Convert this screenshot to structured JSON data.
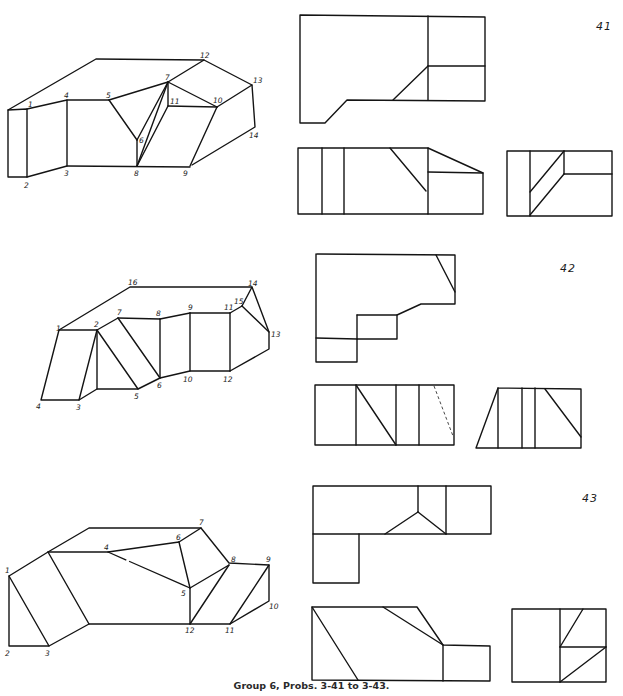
{
  "caption": "Group 6, Probs. 3-41 to 3-43.",
  "problems": [
    {
      "number": "41",
      "isometric_labels": [
        "1",
        "2",
        "3",
        "4",
        "5",
        "6",
        "7",
        "8",
        "9",
        "10",
        "11",
        "12",
        "13",
        "14"
      ],
      "views": [
        "top-view",
        "front-view",
        "side-view"
      ]
    },
    {
      "number": "42",
      "isometric_labels": [
        "1",
        "2",
        "3",
        "4",
        "5",
        "6",
        "7",
        "8",
        "9",
        "10",
        "11",
        "12",
        "13",
        "14",
        "15",
        "16"
      ],
      "views": [
        "top-view",
        "front-view",
        "side-view"
      ],
      "hidden_lines": 1
    },
    {
      "number": "43",
      "isometric_labels": [
        "1",
        "2",
        "3",
        "4",
        "5",
        "6",
        "7",
        "8",
        "9",
        "10",
        "11",
        "12"
      ],
      "views": [
        "top-view",
        "front-view",
        "side-view"
      ]
    }
  ],
  "colors": {
    "ink": "#141414",
    "paper": "#ffffff"
  }
}
